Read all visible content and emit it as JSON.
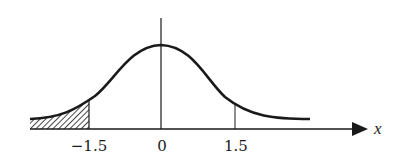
{
  "figure": {
    "axis_label": "x",
    "ticks": [
      {
        "label": "−1.5",
        "value": -1.5
      },
      {
        "label": "0",
        "value": 0
      },
      {
        "label": "1.5",
        "value": 1.5
      }
    ],
    "shaded_region": {
      "from": "-inf",
      "to": -1.5,
      "pattern": "diagonal hatch"
    },
    "colors": {
      "ink": "#1a1a1a",
      "background": "#ffffff"
    }
  }
}
